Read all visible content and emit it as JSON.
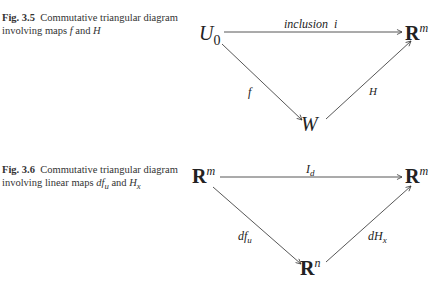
{
  "figures": [
    {
      "id": "fig-3-5",
      "caption": {
        "label": "Fig. 3.5",
        "text_1": "Commutative triangular diagram involving maps ",
        "sym_1": "f",
        "text_2": " and ",
        "sym_2": "H"
      },
      "nodes": {
        "top_left": {
          "base": "U",
          "sub": "0"
        },
        "top_right": {
          "base": "R",
          "sup": "m"
        },
        "bottom": {
          "base": "W"
        }
      },
      "arrows": {
        "top": "inclusion  i",
        "left": "f",
        "right": "H"
      }
    },
    {
      "id": "fig-3-6",
      "caption": {
        "label": "Fig. 3.6",
        "text_1": "Commutative triangular diagram involving linear maps ",
        "sym_1": "df",
        "sym_1_sub": "u",
        "text_2": " and ",
        "sym_2": "H",
        "sym_2_sub": "x"
      },
      "nodes": {
        "top_left": {
          "base": "R",
          "sup": "m"
        },
        "top_right": {
          "base": "R",
          "sup": "m"
        },
        "bottom": {
          "base": "R",
          "sup": "n"
        }
      },
      "arrows": {
        "top": "I",
        "top_sub": "d",
        "left": "df",
        "left_sub": "u",
        "right": "dH",
        "right_sub": "x"
      }
    }
  ]
}
